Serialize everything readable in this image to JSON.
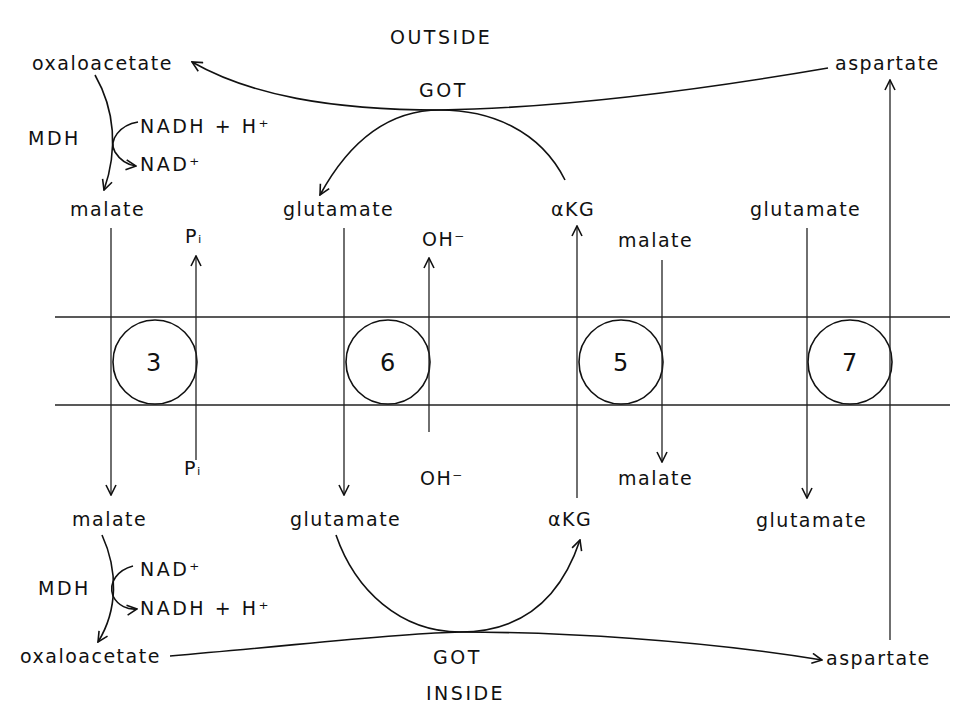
{
  "diagram": {
    "regions": {
      "outside": "OUTSIDE",
      "inside": "INSIDE"
    },
    "enzymes": {
      "got_outside": "GOT",
      "got_inside": "GOT",
      "mdh_outside": "MDH",
      "mdh_inside": "MDH"
    },
    "outside_labels": {
      "oxaloacetate": "oxaloacetate",
      "aspartate": "aspartate",
      "nadh_h": "NADH + H⁺",
      "nad": "NAD⁺",
      "malate": "malate",
      "pi": "Pᵢ",
      "glutamate": "glutamate",
      "oh": "OH⁻",
      "akg": "αKG",
      "malate_5": "malate",
      "glutamate_7": "glutamate"
    },
    "inside_labels": {
      "malate": "malate",
      "pi": "Pᵢ",
      "glutamate": "glutamate",
      "oh": "OH⁻",
      "akg": "αKG",
      "malate_5": "malate",
      "glutamate_7": "glutamate",
      "nad": "NAD⁺",
      "nadh_h": "NADH + H⁺",
      "oxaloacetate": "oxaloacetate",
      "aspartate": "aspartate"
    },
    "transporters": [
      {
        "id": "3",
        "label": "3",
        "exchange": "malate (in) / Pi (out)"
      },
      {
        "id": "6",
        "label": "6",
        "exchange": "glutamate (in) / OH⁻ (out)"
      },
      {
        "id": "5",
        "label": "5",
        "exchange": "αKG (out) / malate (in)"
      },
      {
        "id": "7",
        "label": "7",
        "exchange": "glutamate (in) / aspartate (out)"
      }
    ]
  }
}
